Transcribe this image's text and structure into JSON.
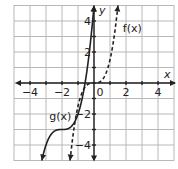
{
  "chart_data": {
    "type": "line",
    "title": "",
    "xlabel": "x",
    "ylabel": "y",
    "xlim": [
      -5,
      5
    ],
    "ylim": [
      -5,
      5
    ],
    "grid": true,
    "x_ticks": [
      {
        "value": -4,
        "label": "−4"
      },
      {
        "value": -2,
        "label": "−2"
      },
      {
        "value": 2,
        "label": "2"
      },
      {
        "value": 4,
        "label": "4"
      }
    ],
    "y_ticks": [
      {
        "value": 4,
        "label": "4"
      },
      {
        "value": 2,
        "label": "2"
      },
      {
        "value": -2,
        "label": "−2"
      },
      {
        "value": -4,
        "label": "−4"
      }
    ],
    "origin_label": "0",
    "series": [
      {
        "name": "g(x)",
        "style": "solid",
        "formula": "(x+2)^3 - 3",
        "label": "g(x)",
        "label_at": [
          -2.8,
          -2.4
        ],
        "points": [
          [
            -3.26,
            -5
          ],
          [
            -3,
            -4
          ],
          [
            -2.5,
            -3.125
          ],
          [
            -2,
            -3
          ],
          [
            -1.5,
            -2.875
          ],
          [
            -1,
            -2
          ],
          [
            -0.56,
            0
          ],
          [
            0,
            5
          ]
        ]
      },
      {
        "name": "f(x)",
        "style": "dashed",
        "formula": "1.5x^3",
        "label": "f(x)",
        "label_at": [
          1.8,
          3.3
        ],
        "points": [
          [
            -1.5,
            -5
          ],
          [
            -1,
            -1.5
          ],
          [
            -0.5,
            -0.19
          ],
          [
            0,
            0
          ],
          [
            0.5,
            0.19
          ],
          [
            1,
            1.5
          ],
          [
            1.5,
            5
          ]
        ]
      }
    ]
  }
}
